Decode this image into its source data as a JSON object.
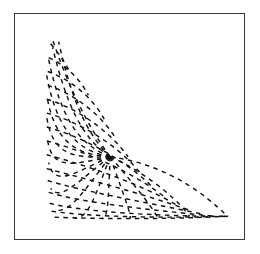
{
  "figure": {
    "label": "curvilinear-mesh-plot",
    "background_color": "#ffffff",
    "frame": {
      "label": "plot-border",
      "x": 14,
      "y": 13,
      "width": 231,
      "height": 227,
      "stroke_color": "#3a3a3a",
      "stroke_width": 1.5
    },
    "line_style": {
      "color": "#111111",
      "width": 1.45,
      "dash_pattern": "4.5 4.5",
      "cap": "butt"
    }
  },
  "chart_data": {
    "type": "line",
    "title": "",
    "xlabel": "",
    "ylabel": "",
    "grid": false,
    "legend": "none",
    "axes_visible": false,
    "tick_labels_x": [],
    "tick_labels_y": [],
    "xlim": [
      0,
      231
    ],
    "ylim": [
      0,
      227
    ],
    "domain": {
      "shape": "curved-triangle",
      "apex": [
        38,
        25
      ],
      "left_edge_x": 32,
      "bottom_edge_y": 205,
      "right_tip": [
        215,
        203
      ],
      "focus": [
        96,
        144
      ]
    },
    "families": [
      {
        "name": "radial-curves",
        "count": 17,
        "origin": [
          96,
          144
        ],
        "description": "Dashed curves fanning outward from the interior focus toward the domain boundary"
      },
      {
        "name": "transverse-arcs",
        "count": 15,
        "description": "Dashed nested arcs crossing the radial family, concave toward the focus"
      }
    ],
    "series": [
      {
        "name": "radial-1",
        "values": [
          96,
          144,
          72,
          112,
          52,
          68,
          38,
          26
        ]
      },
      {
        "name": "radial-2",
        "values": [
          96,
          144,
          70,
          120,
          55,
          78,
          44,
          28
        ]
      },
      {
        "name": "radial-3",
        "values": [
          96,
          144,
          68,
          126,
          52,
          92,
          38,
          34
        ]
      },
      {
        "name": "radial-4",
        "values": [
          96,
          144,
          64,
          132,
          46,
          104,
          34,
          46
        ]
      },
      {
        "name": "radial-5",
        "values": [
          96,
          144,
          62,
          138,
          42,
          116,
          32,
          62
        ]
      },
      {
        "name": "radial-6",
        "values": [
          96,
          144,
          60,
          142,
          40,
          128,
          32,
          82
        ]
      },
      {
        "name": "radial-7",
        "values": [
          96,
          144,
          58,
          146,
          38,
          142,
          32,
          104
        ]
      },
      {
        "name": "radial-8",
        "values": [
          96,
          144,
          58,
          152,
          38,
          158,
          33,
          128
        ]
      },
      {
        "name": "radial-9",
        "values": [
          96,
          144,
          60,
          160,
          40,
          176,
          34,
          150
        ]
      },
      {
        "name": "radial-10",
        "values": [
          96,
          144,
          64,
          168,
          46,
          190,
          36,
          176
        ]
      },
      {
        "name": "radial-11",
        "values": [
          96,
          144,
          70,
          178,
          56,
          200,
          42,
          198
        ]
      },
      {
        "name": "radial-12",
        "values": [
          96,
          144,
          80,
          186,
          74,
          206,
          60,
          206
        ]
      },
      {
        "name": "radial-13",
        "values": [
          96,
          144,
          94,
          188,
          94,
          206,
          88,
          206
        ]
      },
      {
        "name": "radial-14",
        "values": [
          96,
          144,
          110,
          184,
          118,
          204,
          116,
          206
        ]
      },
      {
        "name": "radial-15",
        "values": [
          96,
          144,
          124,
          176,
          142,
          200,
          144,
          206
        ]
      },
      {
        "name": "radial-16",
        "values": [
          96,
          144,
          140,
          164,
          170,
          194,
          176,
          204
        ]
      },
      {
        "name": "radial-17",
        "values": [
          96,
          144,
          156,
          152,
          196,
          186,
          212,
          202
        ]
      },
      {
        "name": "arc-1",
        "values": [
          36,
          30,
          44,
          40,
          50,
          48,
          54,
          56
        ]
      },
      {
        "name": "arc-2",
        "values": [
          34,
          44,
          52,
          52,
          66,
          66,
          74,
          82
        ]
      },
      {
        "name": "arc-3",
        "values": [
          33,
          58,
          56,
          66,
          78,
          84,
          90,
          106
        ]
      },
      {
        "name": "arc-4",
        "values": [
          33,
          72,
          58,
          80,
          86,
          100,
          102,
          126
        ]
      },
      {
        "name": "arc-5",
        "values": [
          32,
          86,
          60,
          94,
          94,
          116,
          114,
          144
        ]
      },
      {
        "name": "arc-6",
        "values": [
          32,
          100,
          62,
          108,
          102,
          130,
          126,
          160
        ]
      },
      {
        "name": "arc-7",
        "values": [
          32,
          114,
          62,
          122,
          108,
          144,
          138,
          174
        ]
      },
      {
        "name": "arc-8",
        "values": [
          32,
          128,
          62,
          136,
          114,
          156,
          150,
          184
        ]
      },
      {
        "name": "arc-9",
        "values": [
          32,
          142,
          62,
          150,
          120,
          168,
          162,
          192
        ]
      },
      {
        "name": "arc-10",
        "values": [
          32,
          156,
          62,
          164,
          126,
          180,
          176,
          198
        ]
      },
      {
        "name": "arc-11",
        "values": [
          33,
          168,
          64,
          178,
          132,
          190,
          190,
          202
        ]
      },
      {
        "name": "arc-12",
        "values": [
          34,
          180,
          66,
          190,
          138,
          198,
          202,
          204
        ]
      },
      {
        "name": "arc-13",
        "values": [
          35,
          191,
          70,
          200,
          146,
          204,
          212,
          204
        ]
      },
      {
        "name": "arc-14",
        "values": [
          37,
          199,
          78,
          205,
          154,
          206,
          215,
          204
        ]
      },
      {
        "name": "arc-15",
        "values": [
          40,
          205,
          90,
          207,
          160,
          207,
          215,
          204
        ]
      }
    ]
  }
}
